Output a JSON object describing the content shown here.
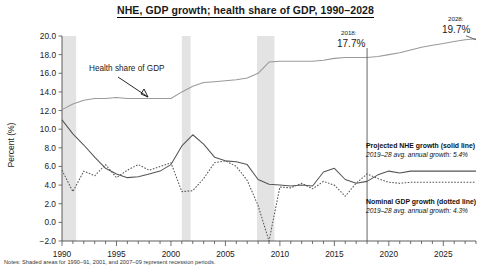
{
  "title": "NHE, GDP growth; health share of GDP, 1990–2028",
  "footnote": "Notes: Shaded areas for 1990–91, 2001, and 2007–09 represent recession periods.",
  "annotations": {
    "marker_2018_label": "2018:",
    "marker_2018_value": "17.7%",
    "marker_2028_label": "2028:",
    "marker_2028_value": "19.7%",
    "share_callout": "Health share of GDP"
  },
  "legend": {
    "nhe_title": "Projected NHE growth (solid line)",
    "nhe_sub": "2019–28 avg. annual growth: 5.4%",
    "gdp_title": "Nominal GDP growth (dotted line)",
    "gdp_sub": "2019–28 avg. annual growth: 4.3%"
  },
  "colors": {
    "share_line": "#9a9a9a",
    "growth_line": "#555555",
    "recession_band": "#e3e3e3",
    "axis": "#4d4d4d"
  },
  "chart_data": {
    "type": "line",
    "title": "NHE, GDP growth; health share of GDP, 1990–2028",
    "xlabel": "",
    "ylabel": "Percent (%)",
    "ylim": [
      -2.0,
      20.0
    ],
    "xlim": [
      1990,
      2028
    ],
    "ytick_labels": [
      "20.0",
      "18.0",
      "16.0",
      "14.0",
      "12.0",
      "10.0",
      "8.0",
      "6.0",
      "4.0",
      "2.0",
      "0.0",
      "-2.0"
    ],
    "yticks": [
      20.0,
      18.0,
      16.0,
      14.0,
      12.0,
      10.0,
      8.0,
      6.0,
      4.0,
      2.0,
      0.0,
      -2.0
    ],
    "xtick_labels": [
      "1990",
      "1995",
      "2000",
      "2005",
      "2010",
      "2015",
      "2020",
      "2025"
    ],
    "xticks": [
      1990,
      1995,
      2000,
      2005,
      2010,
      2015,
      2020,
      2025
    ],
    "grid": false,
    "legend_position": "right-inside",
    "x": [
      1990,
      1991,
      1992,
      1993,
      1994,
      1995,
      1996,
      1997,
      1998,
      1999,
      2000,
      2001,
      2002,
      2003,
      2004,
      2005,
      2006,
      2007,
      2008,
      2009,
      2010,
      2011,
      2012,
      2013,
      2014,
      2015,
      2016,
      2017,
      2018,
      2019,
      2020,
      2021,
      2022,
      2023,
      2024,
      2025,
      2026,
      2027,
      2028
    ],
    "series": [
      {
        "name": "Health share of GDP",
        "style": "solid",
        "color": "#9a9a9a",
        "values": [
          12.1,
          12.7,
          13.1,
          13.3,
          13.3,
          13.4,
          13.3,
          13.3,
          13.3,
          13.3,
          13.3,
          14.0,
          14.6,
          15.0,
          15.1,
          15.2,
          15.3,
          15.5,
          16.0,
          17.2,
          17.3,
          17.3,
          17.3,
          17.3,
          17.4,
          17.6,
          17.7,
          17.7,
          17.7,
          17.8,
          18.0,
          18.2,
          18.5,
          18.8,
          19.0,
          19.2,
          19.4,
          19.6,
          19.7
        ]
      },
      {
        "name": "Projected NHE growth",
        "style": "solid",
        "color": "#555555",
        "values": [
          11.0,
          9.5,
          8.3,
          7.0,
          5.8,
          5.2,
          4.8,
          4.9,
          5.2,
          5.5,
          6.2,
          8.2,
          9.4,
          8.4,
          7.0,
          6.6,
          6.5,
          6.2,
          4.6,
          4.1,
          4.0,
          3.9,
          4.0,
          3.9,
          5.4,
          5.8,
          4.6,
          4.2,
          4.4,
          5.1,
          5.5,
          5.3,
          5.5,
          5.5,
          5.5,
          5.5,
          5.5,
          5.5,
          5.5
        ]
      },
      {
        "name": "Nominal GDP growth",
        "style": "dotted",
        "color": "#555555",
        "values": [
          5.6,
          3.3,
          5.5,
          5.0,
          6.2,
          4.8,
          5.6,
          6.2,
          5.6,
          6.0,
          6.4,
          3.3,
          3.4,
          4.7,
          6.4,
          6.6,
          6.0,
          4.5,
          1.8,
          -2.0,
          3.8,
          3.7,
          4.2,
          3.6,
          4.4,
          4.0,
          2.8,
          4.2,
          5.2,
          4.7,
          4.3,
          4.2,
          4.3,
          4.3,
          4.3,
          4.3,
          4.3,
          4.3,
          4.3
        ]
      }
    ],
    "shaded_regions": [
      {
        "label": "1990–91 recession",
        "start": 1990.0,
        "end": 1991.3
      },
      {
        "label": "2001 recession",
        "start": 2001.0,
        "end": 2001.8
      },
      {
        "label": "2007–09 recession",
        "start": 2007.9,
        "end": 2009.5
      }
    ],
    "markers": [
      {
        "x": 2018,
        "label": "2018:",
        "value": "17.7%",
        "value_num": 17.7
      },
      {
        "x": 2028,
        "label": "2028:",
        "value": "19.7%",
        "value_num": 19.7
      }
    ]
  }
}
